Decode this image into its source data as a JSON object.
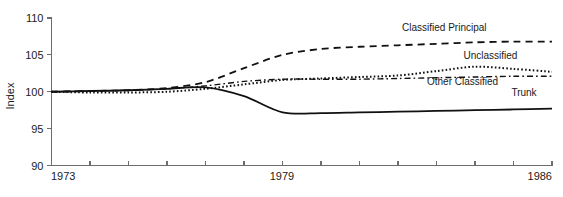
{
  "chart_data": {
    "type": "line",
    "title": "",
    "subtitle": "",
    "xlabel": "",
    "ylabel": "Index",
    "xlim": [
      1973,
      1986
    ],
    "ylim": [
      90,
      110
    ],
    "grid": false,
    "legend_position": "right-inline-labels",
    "y_ticks": [
      90,
      95,
      100,
      105,
      110
    ],
    "y_tick_labels": [
      "90",
      "95",
      "100",
      "105",
      "110"
    ],
    "x_ticks": [
      1973,
      1974,
      1975,
      1976,
      1977,
      1978,
      1979,
      1980,
      1981,
      1982,
      1983,
      1984,
      1985,
      1986
    ],
    "x_tick_labels_shown": [
      "1973",
      "1979",
      "1986"
    ],
    "x_label_left": "1973",
    "x_label_mid": "1979",
    "x_label_right": "1986",
    "x": [
      1973,
      1974,
      1975,
      1976,
      1977,
      1978,
      1979,
      1980,
      1981,
      1982,
      1983,
      1984,
      1985,
      1986
    ],
    "series": [
      {
        "name": "Classified Principal",
        "label": "Classified Principal",
        "style": "dashed",
        "color": "#111111",
        "values": [
          100.0,
          100.1,
          100.2,
          100.5,
          101.3,
          103.2,
          105.0,
          105.8,
          106.1,
          106.3,
          106.5,
          106.7,
          106.8,
          106.8
        ]
      },
      {
        "name": "Unclassified",
        "label": "Unclassified",
        "style": "dotted",
        "color": "#111111",
        "values": [
          100.0,
          99.9,
          99.9,
          100.0,
          100.4,
          101.0,
          101.6,
          101.8,
          102.0,
          102.2,
          102.8,
          103.4,
          103.1,
          102.7
        ]
      },
      {
        "name": "Other Classified",
        "label": "Other Classified",
        "style": "dash-dot",
        "color": "#111111",
        "values": [
          100.0,
          100.1,
          100.2,
          100.4,
          100.8,
          101.4,
          101.7,
          101.7,
          101.7,
          101.8,
          101.9,
          102.0,
          102.1,
          102.1
        ]
      },
      {
        "name": "Trunk",
        "label": "Trunk",
        "style": "solid",
        "color": "#111111",
        "values": [
          100.0,
          100.1,
          100.2,
          100.4,
          100.6,
          99.4,
          97.2,
          97.1,
          97.2,
          97.3,
          97.4,
          97.5,
          97.6,
          97.7
        ]
      }
    ],
    "annotations": [
      {
        "text": "Classified Principal",
        "x": 1984.3,
        "y": 108.2
      },
      {
        "text": "Unclassified",
        "x": 1985.1,
        "y": 104.4
      },
      {
        "text": "Other Classified",
        "x": 1984.6,
        "y": 100.9
      },
      {
        "text": "Trunk",
        "x": 1985.6,
        "y": 99.4
      }
    ]
  }
}
